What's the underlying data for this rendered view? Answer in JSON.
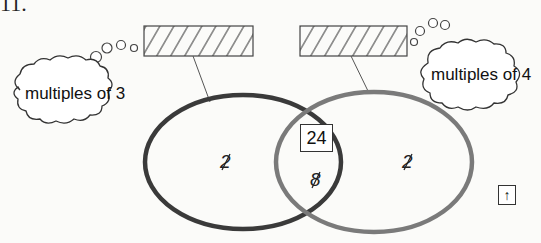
{
  "question_number": "11.",
  "venn": {
    "left_set": {
      "label": "multiples of 3",
      "answer_box": "hatched-blank",
      "only_value": "2",
      "only_value_note": "crossed-out"
    },
    "right_set": {
      "label": "multiples of 4",
      "answer_box": "hatched-blank",
      "only_value": "2",
      "only_value_note": "crossed-out"
    },
    "intersection": {
      "boxed_value": "24",
      "value": "8",
      "value_note": "crossed-out"
    },
    "colors": {
      "left_circle": "#3a3a3a",
      "right_circle": "#7a7a7a",
      "outline": "#333333"
    }
  },
  "controls": {
    "up_arrow_label": "↑"
  }
}
